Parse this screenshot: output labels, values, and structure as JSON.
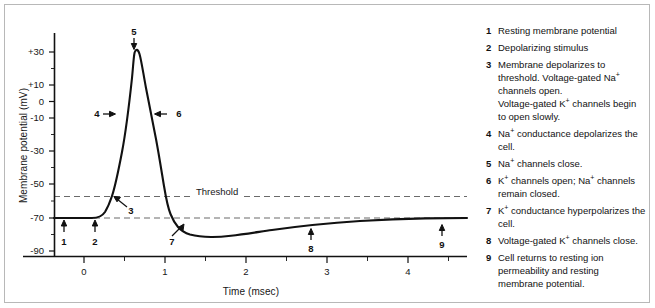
{
  "chart_data": {
    "type": "line",
    "xlabel": "Time (msec)",
    "ylabel": "Membrane potential (mV)",
    "xlim": [
      -0.38,
      4.73
    ],
    "ylim": [
      -95,
      40
    ],
    "xticks": [
      0,
      1,
      2,
      3,
      4
    ],
    "xtick_labels": [
      "0",
      "1",
      "2",
      "3",
      "4"
    ],
    "yticks": [
      30,
      10,
      0,
      -10,
      -30,
      -50,
      -70,
      -90
    ],
    "ytick_labels": [
      "+30",
      "+10",
      "0",
      "-10",
      "-30",
      "-50",
      "-70",
      "-90"
    ],
    "grid": false,
    "legend_position": "right",
    "reference_lines": [
      {
        "name": "threshold",
        "label": "Threshold",
        "value": -55,
        "style": "dashed"
      },
      {
        "name": "resting",
        "label": "",
        "value": -70,
        "style": "dashed"
      }
    ],
    "series": [
      {
        "name": "Membrane potential",
        "x": [
          -0.38,
          -0.2,
          0.0,
          0.1,
          0.16,
          0.24,
          0.32,
          0.36,
          0.42,
          0.48,
          0.54,
          0.6,
          0.62,
          0.68,
          0.74,
          0.82,
          0.9,
          0.98,
          1.06,
          1.12,
          1.18,
          1.24,
          1.3,
          1.4,
          1.55,
          1.7,
          1.85,
          2.1,
          2.5,
          3.0,
          3.5,
          4.0,
          4.4,
          4.73
        ],
        "y": [
          -70,
          -70,
          -70,
          -70,
          -69,
          -66,
          -60,
          -55,
          -44,
          -23,
          2,
          26,
          30,
          27,
          18,
          2,
          -14,
          -30,
          -46,
          -55,
          -63,
          -69,
          -73,
          -77,
          -78,
          -78,
          -77.5,
          -76.5,
          -75,
          -73,
          -72,
          -70.8,
          -70.2,
          -70
        ]
      }
    ],
    "annotations": [
      {
        "id": "1",
        "label": "1",
        "x": -0.25,
        "y": -70,
        "arrow": "up"
      },
      {
        "id": "2",
        "label": "2",
        "x": 0.13,
        "y": -70,
        "arrow": "up"
      },
      {
        "id": "3",
        "label": "3",
        "x": 0.4,
        "y": -55,
        "arrow": "up-left"
      },
      {
        "id": "4",
        "label": "4",
        "x": 0.35,
        "y": -8,
        "arrow": "right"
      },
      {
        "id": "5",
        "label": "5",
        "x": 0.62,
        "y": 32,
        "arrow": "down"
      },
      {
        "id": "6",
        "label": "6",
        "x": 0.92,
        "y": -8,
        "arrow": "left"
      },
      {
        "id": "7",
        "label": "7",
        "x": 1.27,
        "y": -73,
        "arrow": "up-right"
      },
      {
        "id": "8",
        "label": "8",
        "x": 2.8,
        "y": -75,
        "arrow": "up"
      },
      {
        "id": "9",
        "label": "9",
        "x": 4.42,
        "y": -71,
        "arrow": "up"
      }
    ],
    "colors": {
      "curve": "#111111",
      "axis": "#111111",
      "dashed_reference": "#6a6a6a",
      "frame": "#b8b8b8",
      "text": "#111111"
    }
  },
  "axes": {
    "y_title": "Membrane potential (mV)",
    "x_title": "Time (msec)",
    "y_ticks": [
      {
        "label": "+30",
        "value": 30
      },
      {
        "label": "+10",
        "value": 10
      },
      {
        "label": "0",
        "value": 0
      },
      {
        "label": "-10",
        "value": -10
      },
      {
        "label": "-30",
        "value": -30
      },
      {
        "label": "-50",
        "value": -50
      },
      {
        "label": "-70",
        "value": -70
      },
      {
        "label": "-90",
        "value": -90
      }
    ],
    "x_ticks": [
      {
        "label": "0",
        "value": 0
      },
      {
        "label": "1",
        "value": 1
      },
      {
        "label": "2",
        "value": 2
      },
      {
        "label": "3",
        "value": 3
      },
      {
        "label": "4",
        "value": 4
      }
    ]
  },
  "threshold_label": "Threshold",
  "markers": {
    "m1": "1",
    "m2": "2",
    "m3": "3",
    "m4": "4",
    "m5": "5",
    "m6": "6",
    "m7": "7",
    "m8": "8",
    "m9": "9"
  },
  "legend": {
    "items": [
      {
        "num": "1",
        "text": "Resting membrane potential"
      },
      {
        "num": "2",
        "text": "Depolarizing stimulus"
      },
      {
        "num": "3",
        "text": "Membrane depolarizes to threshold. Voltage-gated Na+ channels open.\nVoltage-gated K+ channels begin to open slowly."
      },
      {
        "num": "4",
        "text": "Na+ conductance depolarizes the cell."
      },
      {
        "num": "5",
        "text": "Na+ channels close."
      },
      {
        "num": "6",
        "text": "K+ channels open; Na+ channels remain closed."
      },
      {
        "num": "7",
        "text": "K+ conductance hyperpolarizes the cell."
      },
      {
        "num": "8",
        "text": "Voltage-gated K+ channels close."
      },
      {
        "num": "9",
        "text": "Cell returns to resting ion permeability and resting membrane potential."
      }
    ]
  }
}
